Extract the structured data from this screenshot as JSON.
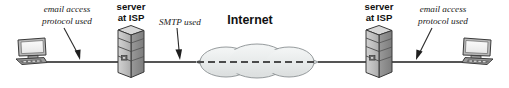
{
  "diagram": {
    "canvas": {
      "width": 509,
      "height": 88,
      "background": "#ffffff"
    },
    "colors": {
      "line": "#555555",
      "text": "#111111",
      "cloud_fill": "#e9ecec",
      "cloud_stroke": "#8a9092",
      "server_front": "#bdbdbd",
      "server_side": "#8e8e8e",
      "server_top": "#d8d8d8",
      "server_stroke": "#3a3a3a",
      "monitor_screen": "#f2f2f2",
      "monitor_body": "#b5b5b5",
      "monitor_stroke": "#3a3a3a",
      "dash": "#4a4a4a"
    },
    "labels": {
      "left_protocol_line1": "email access",
      "left_protocol_line2": "protocol used",
      "left_server_line1": "server",
      "left_server_line2": "at ISP",
      "smtp": "SMTP used",
      "internet": "Internet",
      "right_server_line1": "server",
      "right_server_line2": "at ISP",
      "right_protocol_line1": "email access",
      "right_protocol_line2": "protocol used"
    },
    "nodes": [
      {
        "name": "left-workstation",
        "type": "computer",
        "label": ""
      },
      {
        "name": "left-isp-server",
        "type": "server-tower",
        "label": "server at ISP"
      },
      {
        "name": "internet-cloud",
        "type": "cloud",
        "label": "Internet"
      },
      {
        "name": "right-isp-server",
        "type": "server-tower",
        "label": "server at ISP"
      },
      {
        "name": "right-workstation",
        "type": "computer",
        "label": ""
      }
    ],
    "links": [
      {
        "name": "link-left-client-to-server",
        "protocol": "email access protocol used"
      },
      {
        "name": "link-left-server-to-cloud",
        "protocol": "SMTP used"
      },
      {
        "name": "link-cloud-to-right-server",
        "protocol": ""
      },
      {
        "name": "link-right-server-to-client",
        "protocol": "email access protocol used"
      }
    ]
  }
}
